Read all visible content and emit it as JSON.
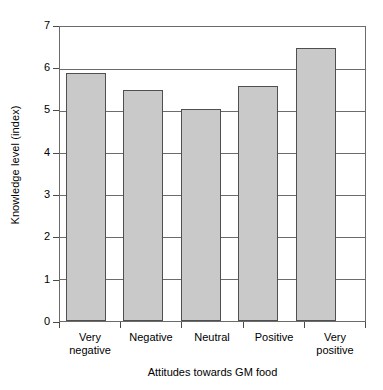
{
  "chart_data": {
    "type": "bar",
    "title": "",
    "xlabel": "Attitudes towards GM food",
    "ylabel": "Knowledge level (index)",
    "categories": [
      "Very negative",
      "Negative",
      "Neutral",
      "Positive",
      "Very positive"
    ],
    "category_lines": [
      [
        "Very",
        "negative"
      ],
      [
        "Negative",
        ""
      ],
      [
        "Neutral",
        ""
      ],
      [
        "Positive",
        ""
      ],
      [
        "Very",
        "positive"
      ]
    ],
    "values": [
      5.9,
      5.5,
      5.05,
      5.6,
      6.5
    ],
    "ylim": [
      0,
      7
    ],
    "ytick_labels": [
      "0",
      "1",
      "2",
      "3",
      "4",
      "5",
      "6",
      "7"
    ],
    "ytick_values": [
      0,
      1,
      2,
      3,
      4,
      5,
      6,
      7
    ],
    "grid": "horizontal",
    "legend": "none",
    "bar_fill_color": "#c9c9c9",
    "bar_edge_color": "#4f4f4f",
    "axis_color": "#6b6b6b"
  }
}
